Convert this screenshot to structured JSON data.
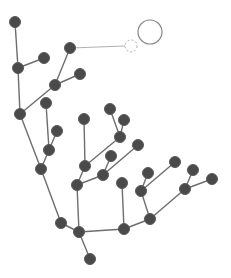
{
  "diagram": {
    "type": "tree",
    "colors": {
      "background": "#ffffff",
      "node_fill": "#4a4a4a",
      "edge": "#6e6e6e",
      "link_line": "#b0b0b0",
      "ghost_circle": "#aaaaaa",
      "target_circle": "#888888"
    },
    "node_radius": 5.5,
    "nodes": [
      {
        "id": "n1",
        "x": 15,
        "y": 22
      },
      {
        "id": "n2",
        "x": 18,
        "y": 68
      },
      {
        "id": "n3",
        "x": 44,
        "y": 58
      },
      {
        "id": "n4",
        "x": 70,
        "y": 48
      },
      {
        "id": "n5",
        "x": 55,
        "y": 85
      },
      {
        "id": "n6",
        "x": 80,
        "y": 74
      },
      {
        "id": "n7",
        "x": 20,
        "y": 114
      },
      {
        "id": "n8",
        "x": 46,
        "y": 103
      },
      {
        "id": "n9",
        "x": 57,
        "y": 131
      },
      {
        "id": "n10",
        "x": 49,
        "y": 150
      },
      {
        "id": "n11",
        "x": 41,
        "y": 169
      },
      {
        "id": "n12",
        "x": 84,
        "y": 119
      },
      {
        "id": "n13",
        "x": 110,
        "y": 109
      },
      {
        "id": "n14",
        "x": 124,
        "y": 120
      },
      {
        "id": "n15",
        "x": 120,
        "y": 137
      },
      {
        "id": "n16",
        "x": 138,
        "y": 145
      },
      {
        "id": "n17",
        "x": 111,
        "y": 156
      },
      {
        "id": "n18",
        "x": 85,
        "y": 166
      },
      {
        "id": "n19",
        "x": 103,
        "y": 175
      },
      {
        "id": "n20",
        "x": 77,
        "y": 185
      },
      {
        "id": "n21",
        "x": 61,
        "y": 223
      },
      {
        "id": "n22",
        "x": 79,
        "y": 232
      },
      {
        "id": "n23",
        "x": 90,
        "y": 259
      },
      {
        "id": "n24",
        "x": 122,
        "y": 183
      },
      {
        "id": "n25",
        "x": 124,
        "y": 229
      },
      {
        "id": "n26",
        "x": 150,
        "y": 219
      },
      {
        "id": "n27",
        "x": 148,
        "y": 173
      },
      {
        "id": "n28",
        "x": 141,
        "y": 191
      },
      {
        "id": "n29",
        "x": 175,
        "y": 162
      },
      {
        "id": "n30",
        "x": 193,
        "y": 170
      },
      {
        "id": "n31",
        "x": 185,
        "y": 189
      },
      {
        "id": "n32",
        "x": 212,
        "y": 179
      }
    ],
    "edges": [
      [
        "n1",
        "n2"
      ],
      [
        "n2",
        "n3"
      ],
      [
        "n2",
        "n7"
      ],
      [
        "n7",
        "n5"
      ],
      [
        "n5",
        "n4"
      ],
      [
        "n5",
        "n6"
      ],
      [
        "n7",
        "n11"
      ],
      [
        "n11",
        "n10"
      ],
      [
        "n10",
        "n8"
      ],
      [
        "n10",
        "n9"
      ],
      [
        "n11",
        "n21"
      ],
      [
        "n21",
        "n22"
      ],
      [
        "n22",
        "n23"
      ],
      [
        "n22",
        "n20"
      ],
      [
        "n20",
        "n18"
      ],
      [
        "n18",
        "n12"
      ],
      [
        "n18",
        "n15"
      ],
      [
        "n15",
        "n13"
      ],
      [
        "n15",
        "n14"
      ],
      [
        "n20",
        "n19"
      ],
      [
        "n19",
        "n17"
      ],
      [
        "n19",
        "n16"
      ],
      [
        "n22",
        "n25"
      ],
      [
        "n25",
        "n24"
      ],
      [
        "n25",
        "n26"
      ],
      [
        "n26",
        "n28"
      ],
      [
        "n28",
        "n27"
      ],
      [
        "n28",
        "n29"
      ],
      [
        "n26",
        "n31"
      ],
      [
        "n31",
        "n30"
      ],
      [
        "n31",
        "n32"
      ]
    ],
    "drag_link": {
      "from": "n4",
      "to_x": 131,
      "to_y": 46
    },
    "ghost_node": {
      "x": 131,
      "y": 46,
      "r": 6
    },
    "target_circle": {
      "x": 150,
      "y": 32,
      "r": 12
    }
  }
}
